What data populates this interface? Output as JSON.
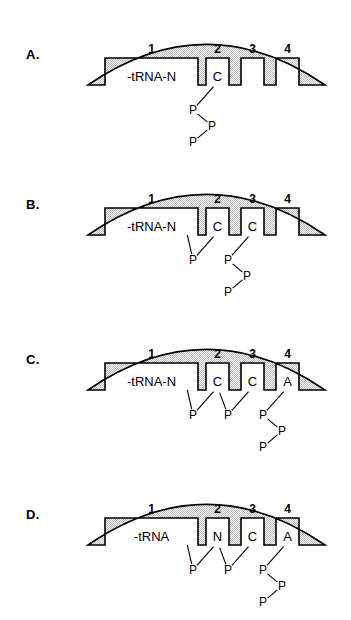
{
  "figure": {
    "colors": {
      "outline": "#000000",
      "stipple": "#b8b8b8",
      "pocket_fill": "#ffffff",
      "background": "#ffffff",
      "text": "#000000"
    },
    "panels": [
      {
        "letter": "A.",
        "site_numbers": [
          "1",
          "2",
          "3",
          "4"
        ],
        "sites": [
          {
            "index": 1,
            "label": "-tRNA-N",
            "wide": true
          },
          {
            "index": 2,
            "label": "C",
            "wide": false
          },
          {
            "index": 3,
            "label": "",
            "wide": false
          },
          {
            "index": 4,
            "label": "",
            "wide": false
          }
        ],
        "phosphates": [
          {
            "label": "P",
            "x": 193,
            "y": 110,
            "role": "alpha"
          },
          {
            "label": "P",
            "x": 212,
            "y": 126,
            "role": "beta"
          },
          {
            "label": "P",
            "x": 193,
            "y": 142,
            "role": "gamma"
          }
        ],
        "bonds": [
          {
            "from": "site2",
            "to": "P1"
          },
          {
            "from": "P1",
            "to": "P2"
          },
          {
            "from": "P2",
            "to": "P3"
          }
        ]
      },
      {
        "letter": "B.",
        "site_numbers": [
          "1",
          "2",
          "3",
          "4"
        ],
        "sites": [
          {
            "index": 1,
            "label": "-tRNA-N",
            "wide": true
          },
          {
            "index": 2,
            "label": "C",
            "wide": false
          },
          {
            "index": 3,
            "label": "C",
            "wide": false
          },
          {
            "index": 4,
            "label": "",
            "wide": false
          }
        ],
        "phosphates": [
          {
            "label": "P",
            "x": 193,
            "y": 110,
            "role": "bridge"
          },
          {
            "label": "P",
            "x": 228,
            "y": 110,
            "role": "alpha"
          },
          {
            "label": "P",
            "x": 247,
            "y": 126,
            "role": "beta"
          },
          {
            "label": "P",
            "x": 228,
            "y": 142,
            "role": "gamma"
          }
        ],
        "bonds": [
          {
            "from": "site1",
            "to": "P1"
          },
          {
            "from": "site2",
            "to": "P1"
          },
          {
            "from": "site3",
            "to": "P2"
          },
          {
            "from": "P2",
            "to": "P3"
          },
          {
            "from": "P3",
            "to": "P4"
          }
        ]
      },
      {
        "letter": "C.",
        "site_numbers": [
          "1",
          "2",
          "3",
          "4"
        ],
        "sites": [
          {
            "index": 1,
            "label": "-tRNA-N",
            "wide": true
          },
          {
            "index": 2,
            "label": "C",
            "wide": false
          },
          {
            "index": 3,
            "label": "C",
            "wide": false
          },
          {
            "index": 4,
            "label": "A",
            "wide": false
          }
        ],
        "phosphates": [
          {
            "label": "P",
            "x": 193,
            "y": 110,
            "role": "bridge"
          },
          {
            "label": "P",
            "x": 228,
            "y": 110,
            "role": "bridge"
          },
          {
            "label": "P",
            "x": 263,
            "y": 110,
            "role": "alpha"
          },
          {
            "label": "P",
            "x": 282,
            "y": 126,
            "role": "beta"
          },
          {
            "label": "P",
            "x": 263,
            "y": 142,
            "role": "gamma"
          }
        ],
        "bonds": [
          {
            "from": "site1",
            "to": "P1"
          },
          {
            "from": "site2",
            "to": "P1"
          },
          {
            "from": "site2",
            "to": "P2"
          },
          {
            "from": "site3",
            "to": "P2"
          },
          {
            "from": "site4",
            "to": "P3"
          },
          {
            "from": "P3",
            "to": "P4"
          },
          {
            "from": "P4",
            "to": "P5"
          }
        ]
      },
      {
        "letter": "D.",
        "site_numbers": [
          "1",
          "2",
          "3",
          "4"
        ],
        "sites": [
          {
            "index": 1,
            "label": "-tRNA",
            "wide": true
          },
          {
            "index": 2,
            "label": "N",
            "wide": false
          },
          {
            "index": 3,
            "label": "C",
            "wide": false
          },
          {
            "index": 4,
            "label": "A",
            "wide": false
          }
        ],
        "phosphates": [
          {
            "label": "P",
            "x": 193,
            "y": 110,
            "role": "bridge"
          },
          {
            "label": "P",
            "x": 228,
            "y": 110,
            "role": "bridge"
          },
          {
            "label": "P",
            "x": 263,
            "y": 110,
            "role": "alpha"
          },
          {
            "label": "P",
            "x": 282,
            "y": 126,
            "role": "beta"
          },
          {
            "label": "P",
            "x": 263,
            "y": 142,
            "role": "gamma"
          }
        ],
        "bonds": [
          {
            "from": "site1",
            "to": "P1"
          },
          {
            "from": "site2",
            "to": "P1"
          },
          {
            "from": "site2",
            "to": "P2"
          },
          {
            "from": "site3",
            "to": "P2"
          },
          {
            "from": "site4",
            "to": "P3"
          },
          {
            "from": "P3",
            "to": "P4"
          },
          {
            "from": "P4",
            "to": "P5"
          }
        ]
      }
    ],
    "geometry": {
      "dome_left_x": 88,
      "dome_right_x": 325,
      "dome_apex_y": 24,
      "baseline_y": 85,
      "pocket_top_y": 58,
      "pocket1": {
        "x": 105,
        "w": 93
      },
      "pocket2": {
        "x": 206,
        "w": 23
      },
      "pocket3": {
        "x": 241,
        "w": 23
      },
      "pocket4": {
        "x": 276,
        "w": 23
      },
      "panel_tops": [
        0,
        150,
        305,
        460
      ]
    }
  }
}
